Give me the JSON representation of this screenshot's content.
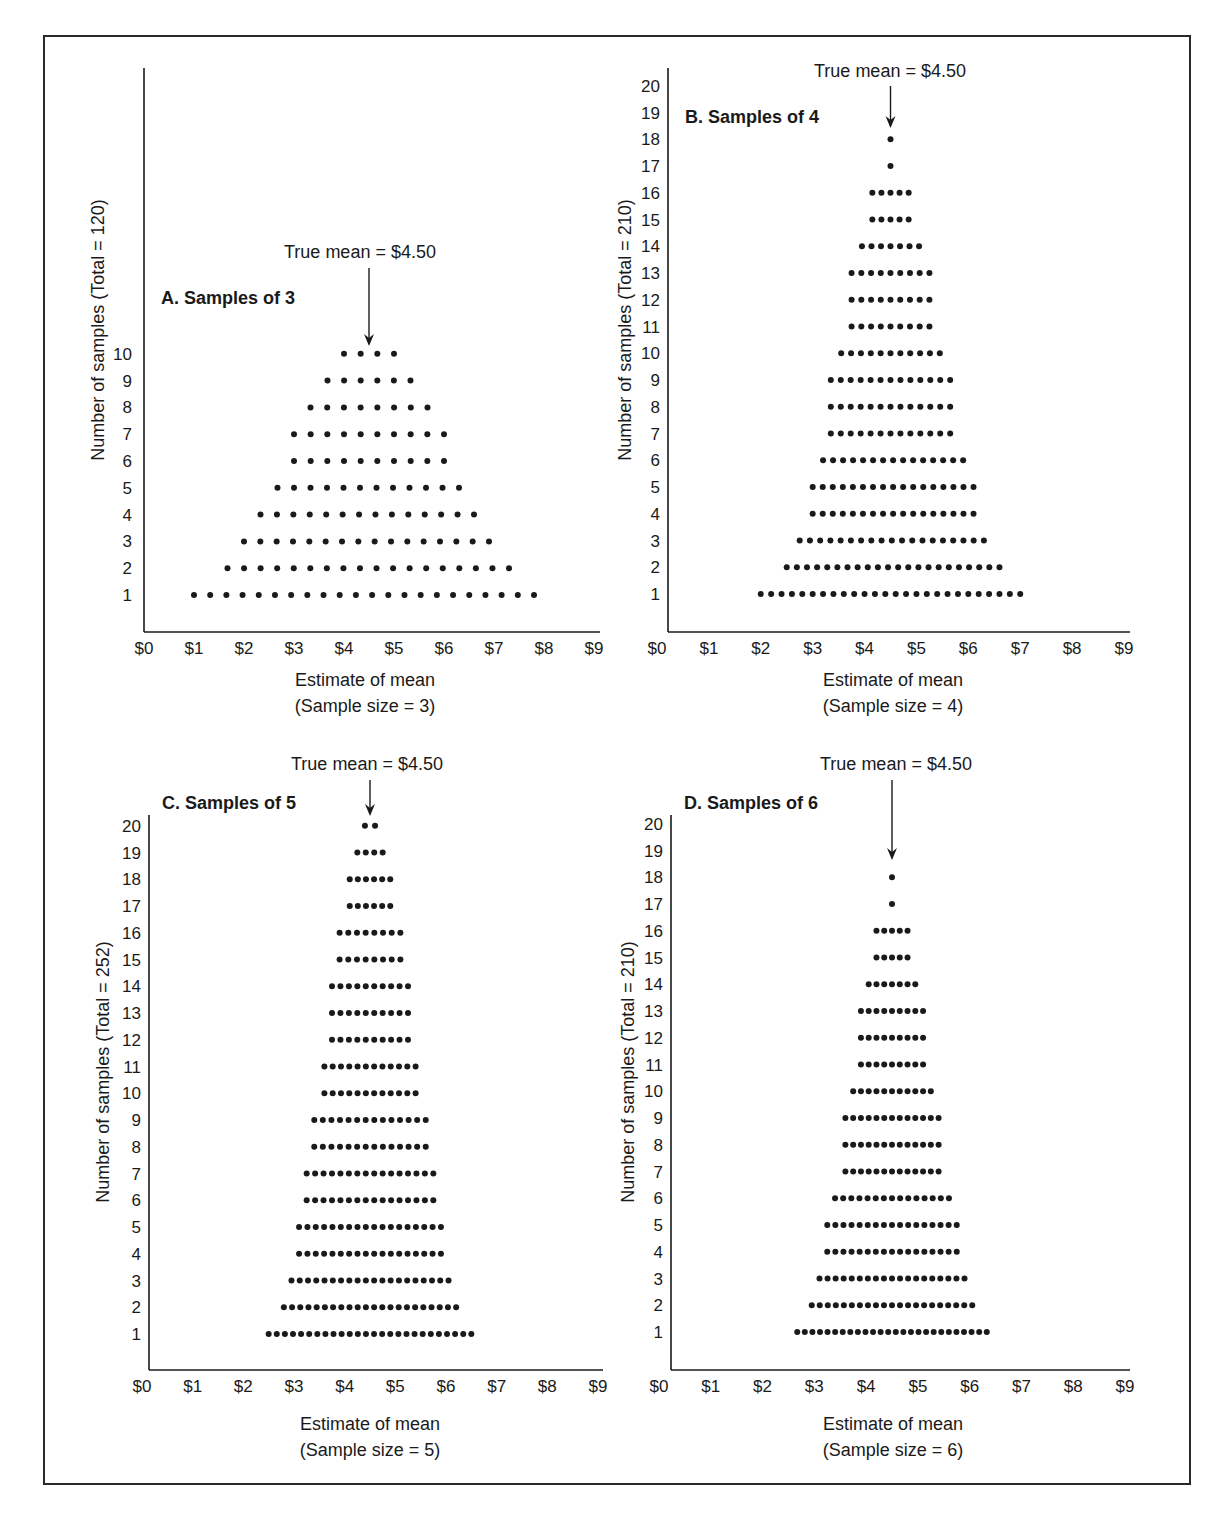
{
  "figure": {
    "true_mean_label": "True mean = $4.50",
    "x_tick_labels": [
      "$0",
      "$1",
      "$2",
      "$3",
      "$4",
      "$5",
      "$6",
      "$7",
      "$8",
      "$9"
    ],
    "xlabel": "Estimate of mean"
  },
  "chart_data": [
    {
      "type": "scatter",
      "title": "A. Samples of 3",
      "xlabel": "Estimate of mean",
      "xlabel_sub": "(Sample size = 3)",
      "ylabel": "Number of samples (Total = 120)",
      "annotation": "True mean = $4.50",
      "annotation_x": 4.5,
      "xlim": [
        0,
        9
      ],
      "ylim": [
        0,
        20
      ],
      "y_ticks": [
        1,
        2,
        3,
        4,
        5,
        6,
        7,
        8,
        9,
        10
      ],
      "x_ticks": [
        "$0",
        "$1",
        "$2",
        "$3",
        "$4",
        "$5",
        "$6",
        "$7",
        "$8",
        "$9"
      ],
      "rows": [
        {
          "count": 1,
          "n": 22,
          "from": 1.0,
          "to": 7.8
        },
        {
          "count": 2,
          "n": 18,
          "from": 1.67,
          "to": 7.3
        },
        {
          "count": 3,
          "n": 16,
          "from": 2.0,
          "to": 6.9
        },
        {
          "count": 4,
          "n": 14,
          "from": 2.33,
          "to": 6.6
        },
        {
          "count": 5,
          "n": 12,
          "from": 2.67,
          "to": 6.3
        },
        {
          "count": 6,
          "n": 10,
          "from": 3.0,
          "to": 6.0
        },
        {
          "count": 7,
          "n": 10,
          "from": 3.0,
          "to": 6.0
        },
        {
          "count": 8,
          "n": 8,
          "from": 3.33,
          "to": 5.67
        },
        {
          "count": 9,
          "n": 6,
          "from": 3.67,
          "to": 5.33
        },
        {
          "count": 10,
          "n": 4,
          "from": 4.0,
          "to": 5.0
        }
      ]
    },
    {
      "type": "scatter",
      "title": "B. Samples of 4",
      "xlabel": "Estimate of mean",
      "xlabel_sub": "(Sample size = 4)",
      "ylabel": "Number of samples (Total = 210)",
      "annotation": "True mean = $4.50",
      "annotation_x": 4.5,
      "xlim": [
        0,
        9
      ],
      "ylim": [
        0,
        20
      ],
      "y_ticks": [
        1,
        2,
        3,
        4,
        5,
        6,
        7,
        8,
        9,
        10,
        11,
        12,
        13,
        14,
        15,
        16,
        17,
        18,
        19,
        20
      ],
      "x_ticks": [
        "$0",
        "$1",
        "$2",
        "$3",
        "$4",
        "$5",
        "$6",
        "$7",
        "$8",
        "$9"
      ],
      "rows": [
        {
          "count": 1,
          "n": 26,
          "from": 2.0,
          "to": 7.0
        },
        {
          "count": 2,
          "n": 22,
          "from": 2.5,
          "to": 6.6
        },
        {
          "count": 3,
          "n": 19,
          "from": 2.75,
          "to": 6.3
        },
        {
          "count": 4,
          "n": 17,
          "from": 3.0,
          "to": 6.1
        },
        {
          "count": 5,
          "n": 17,
          "from": 3.0,
          "to": 6.1
        },
        {
          "count": 6,
          "n": 15,
          "from": 3.2,
          "to": 5.9
        },
        {
          "count": 7,
          "n": 13,
          "from": 3.35,
          "to": 5.65
        },
        {
          "count": 8,
          "n": 13,
          "from": 3.35,
          "to": 5.65
        },
        {
          "count": 9,
          "n": 13,
          "from": 3.35,
          "to": 5.65
        },
        {
          "count": 10,
          "n": 11,
          "from": 3.55,
          "to": 5.45
        },
        {
          "count": 11,
          "n": 9,
          "from": 3.75,
          "to": 5.25
        },
        {
          "count": 12,
          "n": 9,
          "from": 3.75,
          "to": 5.25
        },
        {
          "count": 13,
          "n": 9,
          "from": 3.75,
          "to": 5.25
        },
        {
          "count": 14,
          "n": 7,
          "from": 3.95,
          "to": 5.05
        },
        {
          "count": 15,
          "n": 5,
          "from": 4.15,
          "to": 4.85
        },
        {
          "count": 16,
          "n": 5,
          "from": 4.15,
          "to": 4.85
        },
        {
          "count": 17,
          "n": 1,
          "from": 4.5,
          "to": 4.5
        },
        {
          "count": 18,
          "n": 1,
          "from": 4.5,
          "to": 4.5
        }
      ]
    },
    {
      "type": "scatter",
      "title": "C. Samples of 5",
      "xlabel": "Estimate of mean",
      "xlabel_sub": "(Sample size = 5)",
      "ylabel": "Number of samples (Total = 252)",
      "annotation": "True mean = $4.50",
      "annotation_x": 4.5,
      "xlim": [
        0,
        9
      ],
      "ylim": [
        0,
        20
      ],
      "y_ticks": [
        1,
        2,
        3,
        4,
        5,
        6,
        7,
        8,
        9,
        10,
        11,
        12,
        13,
        14,
        15,
        16,
        17,
        18,
        19,
        20
      ],
      "x_ticks": [
        "$0",
        "$1",
        "$2",
        "$3",
        "$4",
        "$5",
        "$6",
        "$7",
        "$8",
        "$9"
      ],
      "rows": [
        {
          "count": 1,
          "n": 26,
          "from": 2.5,
          "to": 6.5
        },
        {
          "count": 2,
          "n": 22,
          "from": 2.8,
          "to": 6.2
        },
        {
          "count": 3,
          "n": 20,
          "from": 2.95,
          "to": 6.05
        },
        {
          "count": 4,
          "n": 18,
          "from": 3.1,
          "to": 5.9
        },
        {
          "count": 5,
          "n": 18,
          "from": 3.1,
          "to": 5.9
        },
        {
          "count": 6,
          "n": 16,
          "from": 3.25,
          "to": 5.75
        },
        {
          "count": 7,
          "n": 16,
          "from": 3.25,
          "to": 5.75
        },
        {
          "count": 8,
          "n": 14,
          "from": 3.4,
          "to": 5.6
        },
        {
          "count": 9,
          "n": 14,
          "from": 3.4,
          "to": 5.6
        },
        {
          "count": 10,
          "n": 12,
          "from": 3.6,
          "to": 5.4
        },
        {
          "count": 11,
          "n": 12,
          "from": 3.6,
          "to": 5.4
        },
        {
          "count": 12,
          "n": 10,
          "from": 3.75,
          "to": 5.25
        },
        {
          "count": 13,
          "n": 10,
          "from": 3.75,
          "to": 5.25
        },
        {
          "count": 14,
          "n": 10,
          "from": 3.75,
          "to": 5.25
        },
        {
          "count": 15,
          "n": 8,
          "from": 3.9,
          "to": 5.1
        },
        {
          "count": 16,
          "n": 8,
          "from": 3.9,
          "to": 5.1
        },
        {
          "count": 17,
          "n": 6,
          "from": 4.1,
          "to": 4.9
        },
        {
          "count": 18,
          "n": 6,
          "from": 4.1,
          "to": 4.9
        },
        {
          "count": 19,
          "n": 4,
          "from": 4.25,
          "to": 4.75
        },
        {
          "count": 20,
          "n": 2,
          "from": 4.4,
          "to": 4.6
        }
      ]
    },
    {
      "type": "scatter",
      "title": "D. Samples of 6",
      "xlabel": "Estimate of mean",
      "xlabel_sub": "(Sample size = 6)",
      "ylabel": "Number of samples (Total = 210)",
      "annotation": "True mean = $4.50",
      "annotation_x": 4.5,
      "xlim": [
        0,
        9
      ],
      "ylim": [
        0,
        20
      ],
      "y_ticks": [
        1,
        2,
        3,
        4,
        5,
        6,
        7,
        8,
        9,
        10,
        11,
        12,
        13,
        14,
        15,
        16,
        17,
        18,
        19,
        20
      ],
      "x_ticks": [
        "$0",
        "$1",
        "$2",
        "$3",
        "$4",
        "$5",
        "$6",
        "$7",
        "$8",
        "$9"
      ],
      "rows": [
        {
          "count": 1,
          "n": 26,
          "from": 2.67,
          "to": 6.33
        },
        {
          "count": 2,
          "n": 21,
          "from": 2.95,
          "to": 6.05
        },
        {
          "count": 3,
          "n": 19,
          "from": 3.1,
          "to": 5.9
        },
        {
          "count": 4,
          "n": 17,
          "from": 3.25,
          "to": 5.75
        },
        {
          "count": 5,
          "n": 17,
          "from": 3.25,
          "to": 5.75
        },
        {
          "count": 6,
          "n": 15,
          "from": 3.4,
          "to": 5.6
        },
        {
          "count": 7,
          "n": 13,
          "from": 3.6,
          "to": 5.4
        },
        {
          "count": 8,
          "n": 13,
          "from": 3.6,
          "to": 5.4
        },
        {
          "count": 9,
          "n": 13,
          "from": 3.6,
          "to": 5.4
        },
        {
          "count": 10,
          "n": 11,
          "from": 3.75,
          "to": 5.25
        },
        {
          "count": 11,
          "n": 9,
          "from": 3.9,
          "to": 5.1
        },
        {
          "count": 12,
          "n": 9,
          "from": 3.9,
          "to": 5.1
        },
        {
          "count": 13,
          "n": 9,
          "from": 3.9,
          "to": 5.1
        },
        {
          "count": 14,
          "n": 7,
          "from": 4.05,
          "to": 4.95
        },
        {
          "count": 15,
          "n": 5,
          "from": 4.2,
          "to": 4.8
        },
        {
          "count": 16,
          "n": 5,
          "from": 4.2,
          "to": 4.8
        },
        {
          "count": 17,
          "n": 1,
          "from": 4.5,
          "to": 4.5
        },
        {
          "count": 18,
          "n": 1,
          "from": 4.5,
          "to": 4.5
        }
      ]
    }
  ],
  "colors": {
    "ink": "#1a1a1a",
    "frame": "#2a2a2a",
    "background": "#ffffff"
  }
}
